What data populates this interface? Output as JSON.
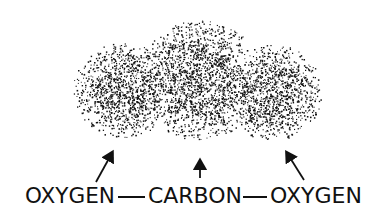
{
  "diagram": {
    "title_hidden": "",
    "ink_color": "#111111",
    "background": "#ffffff",
    "molecule": {
      "atoms": [
        {
          "id": "o1",
          "label": "OXYGEN",
          "x": 25,
          "width": 90
        },
        {
          "id": "c",
          "label": "CARBON",
          "x": 148,
          "width": 94
        },
        {
          "id": "o2",
          "label": "OXYGEN",
          "x": 270,
          "width": 92
        }
      ],
      "bonds": [
        {
          "from": "o1",
          "to": "c",
          "x1": 118,
          "x2": 145
        },
        {
          "from": "c",
          "to": "o2",
          "x1": 243,
          "x2": 267
        }
      ]
    },
    "electron_cloud": {
      "description": "stippled electron cloud over carbon dioxide molecule",
      "lobes": [
        {
          "cx": 125,
          "cy": 90,
          "rx": 52,
          "ry": 48
        },
        {
          "cx": 200,
          "cy": 80,
          "rx": 62,
          "ry": 60
        },
        {
          "cx": 272,
          "cy": 92,
          "rx": 50,
          "ry": 48
        }
      ]
    },
    "arrows": [
      {
        "points_to": "left oxygen lobe",
        "x1": 96,
        "y1": 182,
        "x2": 112,
        "y2": 153
      },
      {
        "points_to": "carbon center",
        "x1": 200,
        "y1": 178,
        "x2": 200,
        "y2": 161
      },
      {
        "points_to": "right oxygen lobe",
        "x1": 304,
        "y1": 180,
        "x2": 287,
        "y2": 153
      }
    ]
  }
}
